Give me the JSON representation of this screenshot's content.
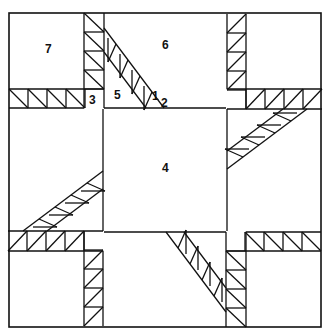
{
  "colors": {
    "line": "#111111",
    "background": "#ffffff"
  },
  "labels": [
    {
      "id": "7",
      "text": "7",
      "x": 45,
      "y": 53,
      "desc": "corner square"
    },
    {
      "id": "6",
      "text": "6",
      "x": 165,
      "y": 49,
      "desc": "side triangle"
    },
    {
      "id": "3",
      "text": "3",
      "x": 93,
      "y": 104,
      "desc": "small square"
    },
    {
      "id": "5",
      "text": "5",
      "x": 118,
      "y": 99,
      "desc": "triangle"
    },
    {
      "id": "1",
      "text": "1",
      "x": 155,
      "y": 100,
      "desc": "small triangle"
    },
    {
      "id": "2",
      "text": "2",
      "x": 165,
      "y": 105,
      "desc": "small triangle"
    },
    {
      "id": "4",
      "text": "4",
      "x": 165,
      "y": 172,
      "desc": "center square"
    }
  ]
}
